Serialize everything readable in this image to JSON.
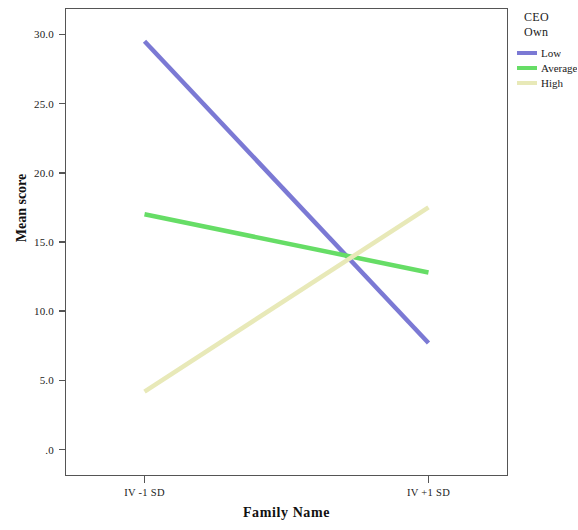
{
  "chart_data": {
    "type": "line",
    "title": "",
    "xlabel": "Family Name",
    "ylabel": "Mean score",
    "categories": [
      "IV -1 SD",
      "IV +1 SD"
    ],
    "x": [
      0,
      1
    ],
    "xlim": [
      -0.28,
      1.28
    ],
    "ylim": [
      -1.9,
      31.9
    ],
    "yticks": [
      0,
      5,
      10,
      15,
      20,
      25,
      30
    ],
    "ytick_labels": [
      ".0",
      "5.0",
      "10.0",
      "15.0",
      "20.0",
      "25.0",
      "30.0"
    ],
    "grid": false,
    "legend_position": "right",
    "legend_title": "CEO Own",
    "series": [
      {
        "name": "Low",
        "values": [
          29.5,
          7.7
        ],
        "color": "#7b79d4"
      },
      {
        "name": "Average",
        "values": [
          17.0,
          12.8
        ],
        "color": "#66dd66"
      },
      {
        "name": "High",
        "values": [
          4.2,
          17.5
        ],
        "color": "#e8e9b8"
      }
    ]
  },
  "axes": {
    "y_title": "Mean score",
    "x_title": "Family Name",
    "y_tick_labels": [
      "30.0",
      "25.0",
      "20.0",
      "15.0",
      "10.0",
      "5.0",
      ".0"
    ],
    "x_tick_labels": [
      "IV -1 SD",
      "IV +1 SD"
    ]
  },
  "legend": {
    "title_line1": "CEO",
    "title_line2": "Own",
    "items": [
      {
        "label": "Low",
        "color": "#7b79d4"
      },
      {
        "label": "Average",
        "color": "#66dd66"
      },
      {
        "label": "High",
        "color": "#e8e9b8"
      }
    ]
  },
  "colors": {
    "low": "#7b79d4",
    "average": "#66dd66",
    "high": "#e8e9b8",
    "frame": "#555555",
    "text": "#1a1a1a"
  }
}
